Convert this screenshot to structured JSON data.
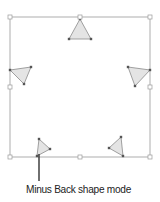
{
  "figure": {
    "caption": "Minus Back shape mode",
    "colors": {
      "bounding_box": "#9a9a9a",
      "triangle_fill": "#e4e4e4",
      "triangle_stroke": "#8a8a8a",
      "anchor": "#555555",
      "pointer": "#333333"
    },
    "bounding_box": {
      "x": 10,
      "y": 17,
      "width": 140,
      "height": 140
    },
    "handles": [
      {
        "x": 10,
        "y": 17
      },
      {
        "x": 80,
        "y": 17
      },
      {
        "x": 150,
        "y": 17
      },
      {
        "x": 10,
        "y": 87
      },
      {
        "x": 150,
        "y": 87
      },
      {
        "x": 10,
        "y": 157
      },
      {
        "x": 80,
        "y": 157
      },
      {
        "x": 150,
        "y": 157
      }
    ],
    "triangles": [
      {
        "name": "top",
        "points": "80,19 69,39 91,39"
      },
      {
        "name": "left",
        "points": "10,70 31,67 24,84"
      },
      {
        "name": "right",
        "points": "128,67 150,70 135,86"
      },
      {
        "name": "bottom-left",
        "points": "39,139 50,149 37,156"
      },
      {
        "name": "bottom-right",
        "points": "121,137 109,148 123,156"
      }
    ],
    "pointer": {
      "x1": 39,
      "y1": 154,
      "x2": 39,
      "y2": 181
    }
  }
}
